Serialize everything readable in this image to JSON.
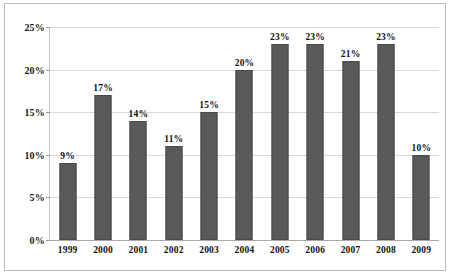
{
  "chart_data": {
    "type": "bar",
    "title": "",
    "xlabel": "",
    "ylabel": "",
    "categories": [
      "1999",
      "2000",
      "2001",
      "2002",
      "2003",
      "2004",
      "2005",
      "2006",
      "2007",
      "2008",
      "2009"
    ],
    "values": [
      9,
      17,
      14,
      11,
      15,
      20,
      23,
      23,
      21,
      23,
      10
    ],
    "data_labels": [
      "9%",
      "17%",
      "14%",
      "11%",
      "15%",
      "20%",
      "23%",
      "23%",
      "21%",
      "23%",
      "10%"
    ],
    "ylim": [
      0,
      25
    ],
    "ytick_values": [
      0,
      5,
      10,
      15,
      20,
      25
    ],
    "ytick_labels": [
      "0%",
      "5%",
      "10%",
      "15%",
      "20%",
      "25%"
    ],
    "grid": true,
    "legend": "none",
    "series_color": "#595959",
    "gridline_color": "#d9d9d9",
    "axis_color": "#aaaaaa",
    "border_color": "#b9b9b9",
    "background": "#ffffff"
  }
}
